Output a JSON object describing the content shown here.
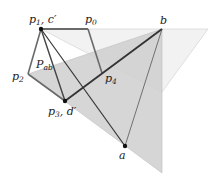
{
  "diagram": {
    "colors": {
      "gray_region": "#cfcfcf",
      "light_region": "#f2f2f2",
      "light_edge": "#d8d8d8",
      "polygon_edge": "#6a6a6a",
      "dark_line": "#333333",
      "thin_line": "#555555",
      "point": "#111111"
    },
    "labels": {
      "p1": "p",
      "p1_sub": "1",
      "p1_suffix": ", c′",
      "p0": "p",
      "p0_sub": "0",
      "p2": "p",
      "p2_sub": "2",
      "p3": "p",
      "p3_sub": "3",
      "p3_suffix": ", d′",
      "p4": "p",
      "p4_sub": "4",
      "pab": "P",
      "pab_sub": "ab",
      "a": "a",
      "b": "b"
    },
    "points": {
      "p0": [
        88,
        29
      ],
      "p1": [
        41,
        29
      ],
      "p2": [
        28,
        74
      ],
      "p3": [
        65,
        101
      ],
      "p4": [
        102,
        73
      ],
      "a": [
        125,
        146
      ],
      "b": [
        162,
        29
      ]
    }
  }
}
